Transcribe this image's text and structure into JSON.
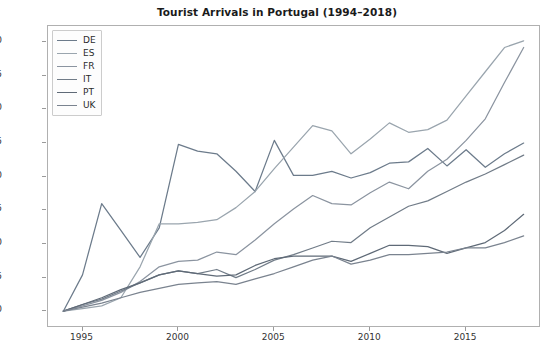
{
  "chart_data": {
    "type": "line",
    "title": "Tourist Arrivals in Portugal (1994–2018)",
    "xlabel": "",
    "ylabel": "Percentage Increase Since 1994",
    "xlim": [
      1993.2,
      2018.8
    ],
    "ylim": [
      -11,
      212
    ],
    "xticks": [
      1995,
      2000,
      2005,
      2010,
      2015
    ],
    "yticks": [
      0,
      25,
      50,
      75,
      100,
      125,
      150,
      175,
      200
    ],
    "grid": false,
    "legend_position": "upper left",
    "x": [
      1994,
      1995,
      1996,
      1997,
      1998,
      1999,
      2000,
      2001,
      2002,
      2003,
      2004,
      2005,
      2006,
      2007,
      2008,
      2009,
      2010,
      2011,
      2012,
      2013,
      2014,
      2015,
      2016,
      2017,
      2018
    ],
    "series": [
      {
        "name": "DE",
        "color": "#6c7b8b",
        "values": [
          0,
          27,
          80,
          60,
          40,
          62,
          124,
          119,
          117,
          104,
          89,
          127,
          101,
          101,
          104,
          99,
          103,
          110,
          111,
          121,
          108,
          120,
          107,
          117,
          125
        ]
      },
      {
        "name": "ES",
        "color": "#9aa5ae",
        "values": [
          0,
          2,
          4,
          10,
          33,
          65,
          65,
          66,
          68,
          77,
          89,
          106,
          122,
          138,
          134,
          117,
          128,
          140,
          133,
          135,
          142,
          160,
          178,
          196,
          201
        ]
      },
      {
        "name": "FR",
        "color": "#8b94a0",
        "values": [
          0,
          4,
          8,
          14,
          22,
          33,
          37,
          38,
          44,
          42,
          53,
          65,
          76,
          86,
          80,
          79,
          88,
          96,
          91,
          104,
          113,
          127,
          143,
          170,
          196
        ]
      },
      {
        "name": "IT",
        "color": "#717c88",
        "values": [
          0,
          5,
          9,
          15,
          21,
          27,
          30,
          28,
          31,
          25,
          31,
          38,
          42,
          47,
          52,
          51,
          62,
          70,
          78,
          82,
          89,
          96,
          102,
          109,
          116
        ]
      },
      {
        "name": "PT",
        "color": "#5f6a77",
        "values": [
          0,
          5,
          10,
          16,
          21,
          27,
          30,
          28,
          26,
          27,
          34,
          39,
          41,
          41,
          41,
          37,
          43,
          49,
          49,
          48,
          43,
          47,
          51,
          60,
          72
        ]
      },
      {
        "name": "UK",
        "color": "#7a838f",
        "values": [
          0,
          3,
          6,
          10,
          14,
          17,
          20,
          21,
          22,
          20,
          24,
          28,
          33,
          38,
          41,
          35,
          38,
          42,
          42,
          43,
          44,
          47,
          47,
          51,
          56
        ]
      }
    ]
  },
  "legend": {
    "items": [
      {
        "label": "DE"
      },
      {
        "label": "ES"
      },
      {
        "label": "FR"
      },
      {
        "label": "IT"
      },
      {
        "label": "PT"
      },
      {
        "label": "UK"
      }
    ]
  },
  "axes": {
    "ytick_labels": [
      "0",
      "25",
      "50",
      "75",
      "100",
      "125",
      "150",
      "175",
      "200"
    ],
    "xtick_labels": [
      "1995",
      "2000",
      "2005",
      "2010",
      "2015"
    ]
  }
}
